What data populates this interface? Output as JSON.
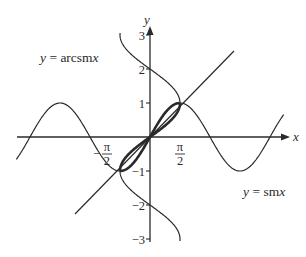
{
  "diagram": {
    "colors": {
      "stroke": "#2a2a2a",
      "background": "#ffffff"
    },
    "axes": {
      "x_label": "x",
      "y_label": "y",
      "y_ticks": [
        {
          "value": 3,
          "label": "3"
        },
        {
          "value": 2,
          "label": "2"
        },
        {
          "value": 1,
          "label": "1"
        },
        {
          "value": -1,
          "label": "−1"
        },
        {
          "value": -2,
          "label": "−2"
        },
        {
          "value": -3,
          "label": "−3"
        }
      ],
      "x_ticks": [
        {
          "value": -1.5708,
          "numerator": "π",
          "denominator": "2",
          "sign": "−"
        },
        {
          "value": 1.5708,
          "numerator": "π",
          "denominator": "2",
          "sign": ""
        }
      ]
    },
    "labels": {
      "arcsin": {
        "prefix": "y",
        "eq": " = ",
        "body": "arcsm",
        "var": "x"
      },
      "sin": {
        "prefix": "y",
        "eq": " = ",
        "body": "sm",
        "var": "x"
      }
    }
  },
  "chart_data": {
    "type": "line",
    "title": "",
    "xlabel": "x",
    "ylabel": "y",
    "series": [
      {
        "name": "y = sin x",
        "function": "sin(x)",
        "x_range": [
          -7.0,
          7.0
        ]
      },
      {
        "name": "y = arcsin x (multi-valued, reflection of sin x in y = x)",
        "function": "x = sin(y)",
        "y_range": [
          -3.06,
          3.06
        ]
      },
      {
        "name": "y = x",
        "function": "x",
        "x_range": [
          -3.7,
          4.3
        ]
      }
    ],
    "highlight": "bold segments of sin x and arcsin x between (-π/2, -1) and (π/2, 1)",
    "intersections": [
      [
        -1.5708,
        -1
      ],
      [
        0,
        0
      ],
      [
        1.5708,
        1
      ]
    ],
    "xlim": [
      -7,
      7.3
    ],
    "ylim": [
      -3.2,
      3.4
    ],
    "grid": false
  }
}
